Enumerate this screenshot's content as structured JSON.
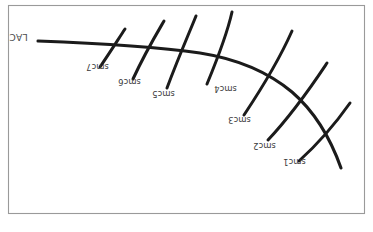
{
  "figure": {
    "title": "",
    "orientation_note": "all labels rendered upside-down (180 degree rotation)",
    "background_color": "#ffffff",
    "frame_color": "#9a9a9a",
    "stroke_color": "#1b1b1b",
    "main_curve": {
      "label": "LAC",
      "label_rotation_deg": 180
    },
    "crossing_curves": [
      {
        "label": "smc7",
        "label_rotation_deg": 180
      },
      {
        "label": "smc6",
        "label_rotation_deg": 180
      },
      {
        "label": "smc5",
        "label_rotation_deg": 180
      },
      {
        "label": "smc4",
        "label_rotation_deg": 180
      },
      {
        "label": "smc3",
        "label_rotation_deg": 180
      },
      {
        "label": "smc2",
        "label_rotation_deg": 180
      },
      {
        "label": "smc1",
        "label_rotation_deg": 180
      }
    ]
  }
}
